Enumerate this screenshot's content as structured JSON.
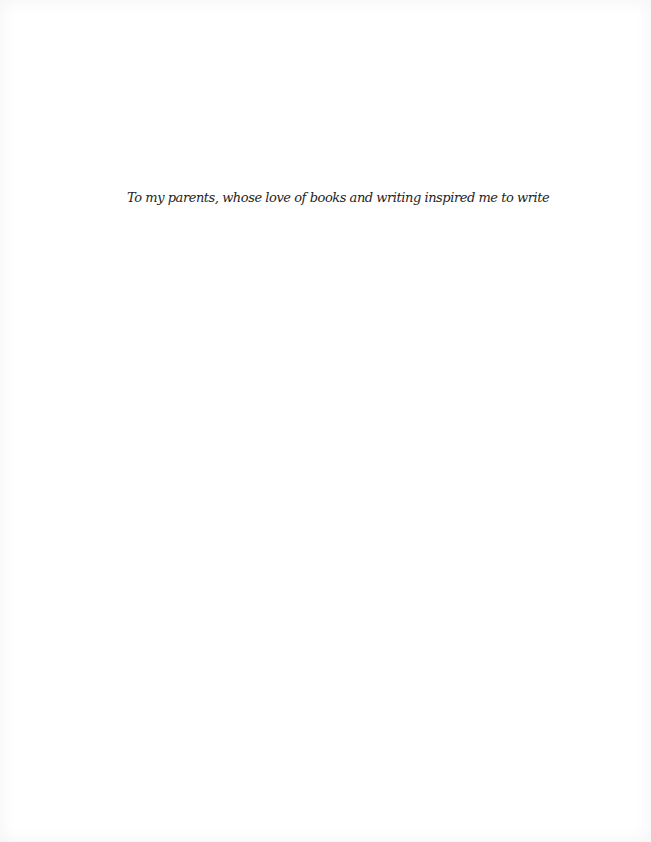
{
  "page": {
    "type": "dedication",
    "background_color": "#ffffff",
    "text_color": "#1e1e1e"
  },
  "dedication": {
    "text": "To my parents, whose love of books and writing inspired me to write"
  }
}
